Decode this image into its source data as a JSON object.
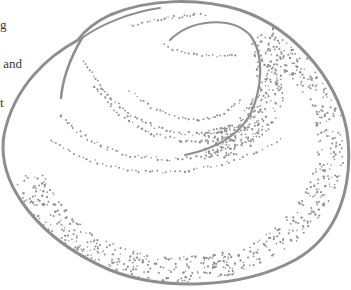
{
  "text_fragment": {
    "lines": [
      "g",
      " and",
      "t"
    ]
  },
  "illustration": {
    "subject": "stippled bun-shaped spiral illustration",
    "stroke_color": "#8e8e8e",
    "dot_color": "#909090"
  }
}
